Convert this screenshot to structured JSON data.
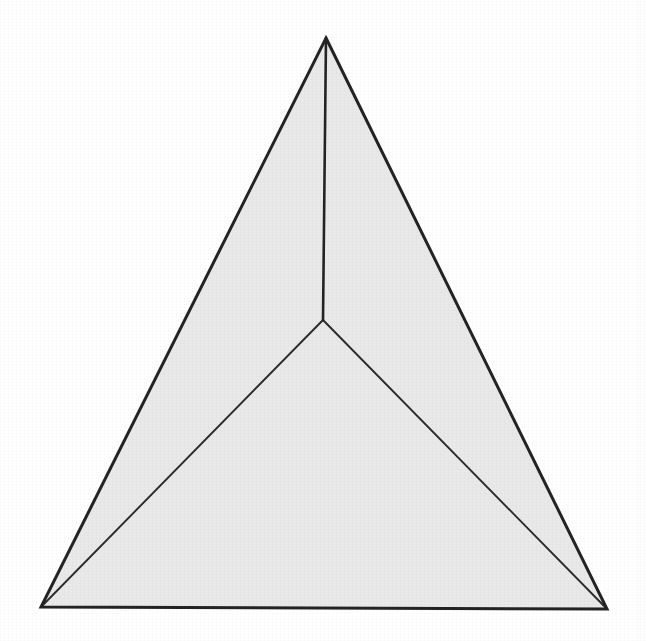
{
  "figure": {
    "caption": "",
    "canvas": {
      "width": 646,
      "height": 641
    },
    "colors": {
      "background": "#ffffff",
      "fill": "#e9e9e9",
      "outline": "#232323",
      "inner_line": "#2a2a2a"
    },
    "stroke_widths": {
      "outline": 3.0,
      "median": 2.6,
      "cevian": 1.9
    },
    "points": [
      {
        "id": "apex",
        "label": "A",
        "x": 326,
        "y": 38,
        "role": "triangle-vertex-top"
      },
      {
        "id": "bottom-left",
        "label": "B",
        "x": 41,
        "y": 607,
        "role": "triangle-vertex-bottom-left"
      },
      {
        "id": "bottom-right",
        "label": "C",
        "x": 607,
        "y": 609,
        "role": "triangle-vertex-bottom-right"
      },
      {
        "id": "interior",
        "label": "P",
        "x": 323,
        "y": 320,
        "role": "interior-junction-point"
      }
    ],
    "outer_triangle": {
      "name": "outer-triangle",
      "vertices": [
        "apex",
        "bottom-right",
        "bottom-left"
      ],
      "path": "M 326 38 L 607 609 L 41 607 Z",
      "filled": true
    },
    "segments": [
      {
        "id": "median-apex-to-interior",
        "name": "vertical-median-segment",
        "from": "interior",
        "to": "apex",
        "path": "M 323 320 L 326 38",
        "weight": "medium"
      },
      {
        "id": "cevian-interior-to-bottom-left",
        "name": "interior-to-bottom-left-segment",
        "from": "interior",
        "to": "bottom-left",
        "path": "M 323 320 L 41 607",
        "weight": "thin"
      },
      {
        "id": "cevian-interior-to-bottom-right",
        "name": "interior-to-bottom-right-segment",
        "from": "interior",
        "to": "bottom-right",
        "path": "M 323 320 L 607 609",
        "weight": "thin"
      }
    ],
    "regions": [
      {
        "id": "region-left",
        "name": "left-subtriangle",
        "vertices": [
          "apex",
          "interior",
          "bottom-left"
        ]
      },
      {
        "id": "region-right",
        "name": "right-subtriangle",
        "vertices": [
          "apex",
          "bottom-right",
          "interior"
        ]
      },
      {
        "id": "region-bottom",
        "name": "bottom-subtriangle",
        "vertices": [
          "interior",
          "bottom-right",
          "bottom-left"
        ]
      }
    ],
    "labels": []
  }
}
